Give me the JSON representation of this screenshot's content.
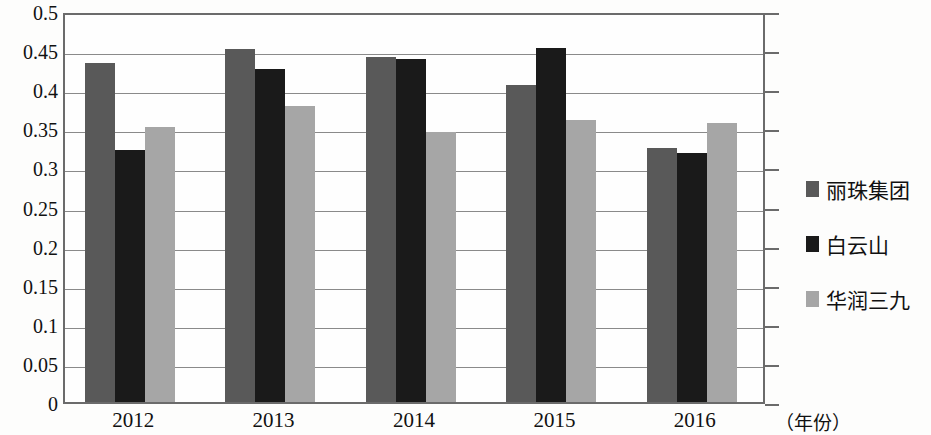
{
  "chart_data": {
    "type": "bar",
    "title": "",
    "subtitle": "",
    "xlabel": "（年份）",
    "ylabel": "",
    "categories": [
      "2012",
      "2013",
      "2014",
      "2015",
      "2016"
    ],
    "series": [
      {
        "name": "丽珠集团",
        "color": "#595959",
        "values": [
          0.434,
          0.451,
          0.441,
          0.405,
          0.325
        ]
      },
      {
        "name": "白云山",
        "color": "#1a1a1a",
        "values": [
          0.322,
          0.426,
          0.439,
          0.453,
          0.318
        ]
      },
      {
        "name": "华润三九",
        "color": "#a6a6a6",
        "values": [
          0.352,
          0.379,
          0.345,
          0.361,
          0.357
        ]
      }
    ],
    "ylim": [
      0,
      0.5
    ],
    "yticks": [
      "0",
      "0.05",
      "0.1",
      "0.15",
      "0.2",
      "0.25",
      "0.3",
      "0.35",
      "0.4",
      "0.45",
      "0.5"
    ],
    "ytick_values": [
      0,
      0.05,
      0.1,
      0.15,
      0.2,
      0.25,
      0.3,
      0.35,
      0.4,
      0.45,
      0.5
    ],
    "grid": true,
    "legend_position": "right",
    "legend": [
      "丽珠集团",
      "白云山",
      "华润三九"
    ]
  },
  "axis": {
    "x_title": "（年份）"
  }
}
